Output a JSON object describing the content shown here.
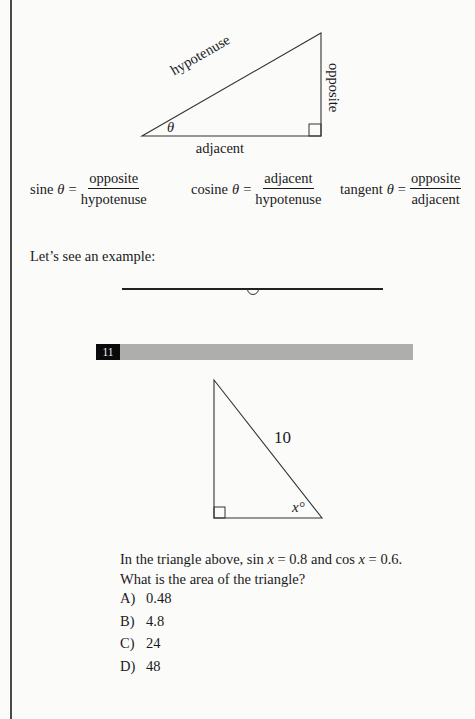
{
  "diagram1": {
    "hypotenuse_label": "hypotenuse",
    "opposite_label": "opposite",
    "adjacent_label": "adjacent",
    "angle_label": "θ"
  },
  "formulas": [
    {
      "name": "sine",
      "theta": "θ",
      "eq": "=",
      "numerator": "opposite",
      "denominator": "hypotenuse"
    },
    {
      "name": "cosine",
      "theta": "θ",
      "eq": "=",
      "numerator": "adjacent",
      "denominator": "hypotenuse"
    },
    {
      "name": "tangent",
      "theta": "θ",
      "eq": "=",
      "numerator": "opposite",
      "denominator": "adjacent"
    }
  ],
  "intro_text": "Let’s see an example:",
  "question": {
    "number": "11",
    "diagram": {
      "hypotenuse_label": "10",
      "angle_label": "x°"
    },
    "line1_a": "In the triangle above, sin ",
    "line1_var1": "x",
    "line1_b": " = 0.8 and cos ",
    "line1_var2": "x",
    "line1_c": " = 0.6.",
    "line2": "What is the area of the triangle?",
    "choices": [
      {
        "letter": "A)",
        "value": "0.48"
      },
      {
        "letter": "B)",
        "value": "4.8"
      },
      {
        "letter": "C)",
        "value": "24"
      },
      {
        "letter": "D)",
        "value": "48"
      }
    ]
  }
}
